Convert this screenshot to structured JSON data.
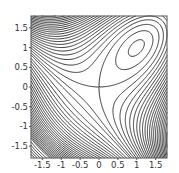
{
  "chart_data": {
    "type": "contour",
    "title": "",
    "xlabel": "",
    "ylabel": "",
    "function": "x^3 + y^3 - 3*x*y",
    "xlim": [
      -1.8,
      1.8
    ],
    "ylim": [
      -1.8,
      1.8
    ],
    "x_ticks": [
      -1.5,
      -1,
      -0.5,
      0,
      0.5,
      1,
      1.5
    ],
    "x_tick_labels": [
      "-1.5",
      "-1",
      "-0.5",
      "0",
      "0.5",
      "1",
      "1.5"
    ],
    "y_ticks": [
      -1.5,
      -1,
      -0.5,
      0,
      0.5,
      1,
      1.5
    ],
    "y_tick_labels": [
      "-1.5",
      "-1",
      "-0.5",
      "0",
      "0.5",
      "1",
      "1.5"
    ],
    "contour_levels": [
      -0.9,
      -0.5,
      0,
      0.5,
      1,
      1.5,
      2,
      2.5,
      3,
      3.5,
      4,
      4.5,
      5,
      5.5,
      6,
      6.5,
      7,
      7.5,
      8,
      8.5,
      9,
      9.5,
      10,
      10.5,
      11,
      11.5,
      12,
      12.5,
      13,
      13.5,
      14,
      14.5,
      15,
      15.5,
      16,
      16.5,
      17,
      17.5,
      18,
      18.5,
      19,
      19.5,
      20,
      -1.5,
      -2,
      -2.5,
      -3,
      -3.5,
      -4,
      -4.5,
      -5,
      -5.5,
      -6,
      -6.5,
      -7,
      -7.5,
      -8,
      -8.5,
      -9,
      -9.5,
      -10,
      -10.5,
      -11,
      -11.5,
      -12,
      -12.5,
      -13,
      -13.5,
      -14,
      -14.5,
      -15,
      -16,
      -17,
      -18,
      -19,
      -20
    ],
    "features": {
      "local_minimum": [
        1,
        1
      ],
      "saddle_point": [
        0,
        0
      ]
    },
    "line_color": "#222222",
    "frame_color": "#555555"
  },
  "layout": {
    "plot_left": 31,
    "plot_top": 16,
    "plot_width": 136,
    "plot_height": 142
  }
}
